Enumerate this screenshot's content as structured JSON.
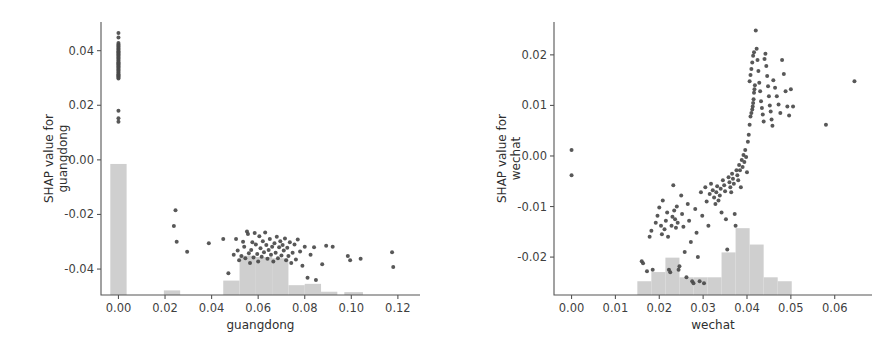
{
  "figure": {
    "background": "#ffffff",
    "point_color": "#4a4a4a",
    "hist_color": "#cfcfcf",
    "axis_color": "#555555"
  },
  "chart_data": [
    {
      "type": "scatter",
      "panel": "left",
      "title": "",
      "xlabel": "guangdong",
      "ylabel": "SHAP value for guangdong",
      "xlim": [
        -0.0075,
        0.1295
      ],
      "ylim": [
        -0.0495,
        0.0505
      ],
      "xticks": [
        0.0,
        0.02,
        0.04,
        0.06,
        0.08,
        0.1,
        0.12
      ],
      "xticklabels": [
        "0.00",
        "0.02",
        "0.04",
        "0.06",
        "0.08",
        "0.10",
        "0.12"
      ],
      "yticks": [
        0.04,
        0.02,
        0.0,
        -0.02,
        -0.04
      ],
      "yticklabels": [
        "0.04",
        "0.02",
        "0.00",
        "-0.02",
        "-0.04"
      ],
      "grid": false,
      "legend": "none",
      "points": [
        [
          0.0,
          0.0465
        ],
        [
          0.0,
          0.0448
        ],
        [
          0.0,
          0.0428
        ],
        [
          0.0,
          0.0423
        ],
        [
          0.0,
          0.0418
        ],
        [
          0.0,
          0.0414
        ],
        [
          0.0,
          0.041
        ],
        [
          0.0,
          0.0406
        ],
        [
          0.0,
          0.0402
        ],
        [
          0.0,
          0.0398
        ],
        [
          0.0,
          0.0394
        ],
        [
          0.0,
          0.039
        ],
        [
          0.0,
          0.0386
        ],
        [
          0.0,
          0.0382
        ],
        [
          0.0,
          0.0378
        ],
        [
          0.0,
          0.0374
        ],
        [
          0.0,
          0.037
        ],
        [
          0.0,
          0.0366
        ],
        [
          0.0,
          0.0362
        ],
        [
          0.0,
          0.0358
        ],
        [
          0.0,
          0.0354
        ],
        [
          0.0,
          0.035
        ],
        [
          0.0,
          0.0346
        ],
        [
          0.0,
          0.0342
        ],
        [
          0.0,
          0.0338
        ],
        [
          0.0,
          0.0334
        ],
        [
          0.0,
          0.033
        ],
        [
          0.0,
          0.0326
        ],
        [
          0.0,
          0.0322
        ],
        [
          0.0,
          0.0318
        ],
        [
          0.0,
          0.0314
        ],
        [
          0.0,
          0.031
        ],
        [
          0.0,
          0.0306
        ],
        [
          0.0,
          0.0302
        ],
        [
          0.0,
          0.0298
        ],
        [
          0.0,
          0.018
        ],
        [
          0.0,
          0.0152
        ],
        [
          0.0,
          0.014
        ],
        [
          0.0245,
          -0.0185
        ],
        [
          0.0238,
          -0.0242
        ],
        [
          0.025,
          -0.03
        ],
        [
          0.0295,
          -0.0337
        ],
        [
          0.0388,
          -0.0305
        ],
        [
          0.045,
          -0.029
        ],
        [
          0.0472,
          -0.0415
        ],
        [
          0.0495,
          -0.0348
        ],
        [
          0.0505,
          -0.029
        ],
        [
          0.0512,
          -0.0332
        ],
        [
          0.0518,
          -0.0368
        ],
        [
          0.0528,
          -0.0352
        ],
        [
          0.0535,
          -0.03
        ],
        [
          0.054,
          -0.0318
        ],
        [
          0.0545,
          -0.036
        ],
        [
          0.0552,
          -0.0262
        ],
        [
          0.0556,
          -0.0272
        ],
        [
          0.056,
          -0.0342
        ],
        [
          0.0565,
          -0.0378
        ],
        [
          0.057,
          -0.033
        ],
        [
          0.0575,
          -0.0302
        ],
        [
          0.058,
          -0.0358
        ],
        [
          0.0585,
          -0.0268
        ],
        [
          0.059,
          -0.031
        ],
        [
          0.0596,
          -0.0345
        ],
        [
          0.06,
          -0.0372
        ],
        [
          0.0605,
          -0.028
        ],
        [
          0.061,
          -0.0324
        ],
        [
          0.0615,
          -0.0355
        ],
        [
          0.062,
          -0.0298
        ],
        [
          0.0625,
          -0.0338
        ],
        [
          0.063,
          -0.0266
        ],
        [
          0.0635,
          -0.0312
        ],
        [
          0.064,
          -0.0362
        ],
        [
          0.0645,
          -0.033
        ],
        [
          0.065,
          -0.029
        ],
        [
          0.0655,
          -0.0348
        ],
        [
          0.066,
          -0.0318
        ],
        [
          0.0665,
          -0.0372
        ],
        [
          0.067,
          -0.0305
        ],
        [
          0.0675,
          -0.034
        ],
        [
          0.068,
          -0.0282
        ],
        [
          0.0685,
          -0.036
        ],
        [
          0.069,
          -0.032
        ],
        [
          0.0695,
          -0.0298
        ],
        [
          0.07,
          -0.035
        ],
        [
          0.0705,
          -0.0312
        ],
        [
          0.071,
          -0.0332
        ],
        [
          0.0715,
          -0.0288
        ],
        [
          0.072,
          -0.0368
        ],
        [
          0.0725,
          -0.0322
        ],
        [
          0.073,
          -0.0352
        ],
        [
          0.0736,
          -0.0302
        ],
        [
          0.0742,
          -0.0378
        ],
        [
          0.0748,
          -0.034
        ],
        [
          0.0756,
          -0.031
        ],
        [
          0.0762,
          -0.0365
        ],
        [
          0.077,
          -0.0292
        ],
        [
          0.078,
          -0.0336
        ],
        [
          0.079,
          -0.0388
        ],
        [
          0.08,
          -0.0318
        ],
        [
          0.0812,
          -0.0432
        ],
        [
          0.0825,
          -0.0348
        ],
        [
          0.084,
          -0.032
        ],
        [
          0.0848,
          -0.044
        ],
        [
          0.0875,
          -0.0382
        ],
        [
          0.0892,
          -0.0315
        ],
        [
          0.092,
          -0.0318
        ],
        [
          0.0985,
          -0.0352
        ],
        [
          0.0995,
          -0.0368
        ],
        [
          0.104,
          -0.0362
        ],
        [
          0.1175,
          -0.0338
        ],
        [
          0.118,
          -0.0392
        ]
      ],
      "histogram": {
        "bins": [
          {
            "x0": -0.0035,
            "x1": 0.0035,
            "height": 1.0
          },
          {
            "x0": 0.0195,
            "x1": 0.0265,
            "height": 0.035
          },
          {
            "x0": 0.045,
            "x1": 0.052,
            "height": 0.11
          },
          {
            "x0": 0.052,
            "x1": 0.059,
            "height": 0.3
          },
          {
            "x0": 0.059,
            "x1": 0.066,
            "height": 0.29
          },
          {
            "x0": 0.066,
            "x1": 0.073,
            "height": 0.28
          },
          {
            "x0": 0.073,
            "x1": 0.08,
            "height": 0.075
          },
          {
            "x0": 0.08,
            "x1": 0.087,
            "height": 0.085
          },
          {
            "x0": 0.087,
            "x1": 0.094,
            "height": 0.025
          },
          {
            "x0": 0.097,
            "x1": 0.105,
            "height": 0.022
          }
        ],
        "max_fraction_of_axis": 1.0
      }
    },
    {
      "type": "scatter",
      "panel": "right",
      "title": "",
      "xlabel": "wechat",
      "ylabel": "SHAP value for wechat",
      "xlim": [
        -0.004,
        0.0685
      ],
      "ylim": [
        -0.0275,
        0.0265
      ],
      "xticks": [
        0.0,
        0.01,
        0.02,
        0.03,
        0.04,
        0.05,
        0.06
      ],
      "xticklabels": [
        "0.00",
        "0.01",
        "0.02",
        "0.03",
        "0.04",
        "0.05",
        "0.06"
      ],
      "yticks": [
        0.02,
        0.01,
        0.0,
        -0.01,
        -0.02
      ],
      "yticklabels": [
        "0.02",
        "0.01",
        "0.00",
        "-0.01",
        "-0.02"
      ],
      "grid": false,
      "legend": "none",
      "points": [
        [
          0.0,
          0.0012
        ],
        [
          0.0,
          -0.0038
        ],
        [
          0.016,
          -0.0208
        ],
        [
          0.0163,
          -0.0212
        ],
        [
          0.0172,
          -0.0228
        ],
        [
          0.0185,
          -0.0225
        ],
        [
          0.0178,
          -0.016
        ],
        [
          0.0182,
          -0.0148
        ],
        [
          0.0192,
          -0.0132
        ],
        [
          0.0196,
          -0.0118
        ],
        [
          0.02,
          -0.0102
        ],
        [
          0.0204,
          -0.0138
        ],
        [
          0.0206,
          -0.0155
        ],
        [
          0.0208,
          -0.0088
        ],
        [
          0.0212,
          -0.0145
        ],
        [
          0.0215,
          -0.0128
        ],
        [
          0.0218,
          -0.0112
        ],
        [
          0.022,
          -0.016
        ],
        [
          0.0222,
          -0.0225
        ],
        [
          0.0225,
          -0.023
        ],
        [
          0.0228,
          -0.0138
        ],
        [
          0.023,
          -0.012
        ],
        [
          0.0232,
          -0.0058
        ],
        [
          0.0234,
          -0.0108
        ],
        [
          0.0236,
          -0.0125
        ],
        [
          0.0238,
          -0.0142
        ],
        [
          0.024,
          -0.01
        ],
        [
          0.0242,
          -0.0132
        ],
        [
          0.0244,
          -0.0225
        ],
        [
          0.0246,
          -0.0218
        ],
        [
          0.025,
          -0.0078
        ],
        [
          0.0252,
          -0.0115
        ],
        [
          0.0255,
          -0.014
        ],
        [
          0.0258,
          -0.019
        ],
        [
          0.0262,
          -0.024
        ],
        [
          0.0265,
          -0.0095
        ],
        [
          0.0268,
          -0.0128
        ],
        [
          0.0272,
          -0.017
        ],
        [
          0.0275,
          -0.0248
        ],
        [
          0.0278,
          -0.0252
        ],
        [
          0.0282,
          -0.0105
        ],
        [
          0.0285,
          -0.0152
        ],
        [
          0.0288,
          -0.02
        ],
        [
          0.0292,
          -0.0248
        ],
        [
          0.0295,
          -0.0072
        ],
        [
          0.0298,
          -0.0118
        ],
        [
          0.0302,
          -0.0252
        ],
        [
          0.0305,
          -0.0062
        ],
        [
          0.0308,
          -0.009
        ],
        [
          0.0312,
          -0.0138
        ],
        [
          0.0315,
          -0.0075
        ],
        [
          0.0318,
          -0.0055
        ],
        [
          0.0322,
          -0.0068
        ],
        [
          0.0325,
          -0.0082
        ],
        [
          0.0328,
          -0.0095
        ],
        [
          0.033,
          -0.0072
        ],
        [
          0.0332,
          -0.006
        ],
        [
          0.0335,
          -0.0088
        ],
        [
          0.0338,
          -0.0078
        ],
        [
          0.034,
          -0.0065
        ],
        [
          0.0342,
          -0.0112
        ],
        [
          0.0345,
          -0.0048
        ],
        [
          0.0348,
          -0.0058
        ],
        [
          0.035,
          -0.007
        ],
        [
          0.0352,
          -0.0125
        ],
        [
          0.0355,
          -0.0185
        ],
        [
          0.0358,
          -0.0042
        ],
        [
          0.036,
          -0.0052
        ],
        [
          0.0362,
          -0.0062
        ],
        [
          0.0364,
          -0.0072
        ],
        [
          0.0366,
          -0.0035
        ],
        [
          0.0368,
          -0.0045
        ],
        [
          0.037,
          -0.0055
        ],
        [
          0.0372,
          -0.0115
        ],
        [
          0.0374,
          -0.0138
        ],
        [
          0.0376,
          -0.0028
        ],
        [
          0.0378,
          -0.0038
        ],
        [
          0.038,
          -0.0048
        ],
        [
          0.0382,
          -0.0018
        ],
        [
          0.0384,
          -0.0028
        ],
        [
          0.0386,
          -0.0062
        ],
        [
          0.0388,
          -0.0008
        ],
        [
          0.039,
          -0.0022
        ],
        [
          0.0392,
          0.0002
        ],
        [
          0.0394,
          -0.0012
        ],
        [
          0.0396,
          0.0012
        ],
        [
          0.0398,
          -0.0002
        ],
        [
          0.04,
          -0.0032
        ],
        [
          0.0402,
          0.0028
        ],
        [
          0.0404,
          0.0042
        ],
        [
          0.0406,
          0.0062
        ],
        [
          0.0408,
          0.0078
        ],
        [
          0.041,
          0.0085
        ],
        [
          0.0412,
          0.0092
        ],
        [
          0.0413,
          0.0098
        ],
        [
          0.0414,
          0.0105
        ],
        [
          0.0415,
          0.0112
        ],
        [
          0.0416,
          0.0125
        ],
        [
          0.0417,
          0.0132
        ],
        [
          0.0418,
          0.014
        ],
        [
          0.0406,
          0.0148
        ],
        [
          0.0408,
          0.016
        ],
        [
          0.041,
          0.0172
        ],
        [
          0.0412,
          0.0185
        ],
        [
          0.0414,
          0.0198
        ],
        [
          0.0416,
          0.0205
        ],
        [
          0.042,
          0.0248
        ],
        [
          0.0422,
          0.0212
        ],
        [
          0.0424,
          0.019
        ],
        [
          0.0426,
          0.0168
        ],
        [
          0.0428,
          0.0145
        ],
        [
          0.043,
          0.0128
        ],
        [
          0.0432,
          0.0108
        ],
        [
          0.0434,
          0.0095
        ],
        [
          0.0436,
          0.0082
        ],
        [
          0.0438,
          0.0068
        ],
        [
          0.044,
          0.0192
        ],
        [
          0.0442,
          0.0202
        ],
        [
          0.0444,
          0.0178
        ],
        [
          0.0446,
          0.0158
        ],
        [
          0.0448,
          0.0138
        ],
        [
          0.045,
          0.0118
        ],
        [
          0.0452,
          0.01
        ],
        [
          0.0454,
          0.0088
        ],
        [
          0.0456,
          0.0072
        ],
        [
          0.0458,
          0.006
        ],
        [
          0.046,
          0.015
        ],
        [
          0.0464,
          0.0135
        ],
        [
          0.0468,
          0.0118
        ],
        [
          0.0472,
          0.0102
        ],
        [
          0.0476,
          0.0085
        ],
        [
          0.048,
          0.019
        ],
        [
          0.0484,
          0.0162
        ],
        [
          0.0488,
          0.0128
        ],
        [
          0.0492,
          0.0098
        ],
        [
          0.0496,
          0.008
        ],
        [
          0.05,
          0.0132
        ],
        [
          0.0505,
          0.0098
        ],
        [
          0.058,
          0.0062
        ],
        [
          0.0645,
          0.0148
        ]
      ],
      "histogram": {
        "bins": [
          {
            "x0": 0.015,
            "x1": 0.0182,
            "height": 0.105
          },
          {
            "x0": 0.0182,
            "x1": 0.0214,
            "height": 0.175
          },
          {
            "x0": 0.0214,
            "x1": 0.0246,
            "height": 0.285
          },
          {
            "x0": 0.0246,
            "x1": 0.0278,
            "height": 0.135
          },
          {
            "x0": 0.0278,
            "x1": 0.031,
            "height": 0.135
          },
          {
            "x0": 0.031,
            "x1": 0.0342,
            "height": 0.135
          },
          {
            "x0": 0.0342,
            "x1": 0.0374,
            "height": 0.325
          },
          {
            "x0": 0.0374,
            "x1": 0.0406,
            "height": 0.51
          },
          {
            "x0": 0.0406,
            "x1": 0.0438,
            "height": 0.385
          },
          {
            "x0": 0.0438,
            "x1": 0.047,
            "height": 0.135
          },
          {
            "x0": 0.047,
            "x1": 0.0502,
            "height": 0.105
          }
        ],
        "max_fraction_of_axis": 1.0
      }
    }
  ]
}
